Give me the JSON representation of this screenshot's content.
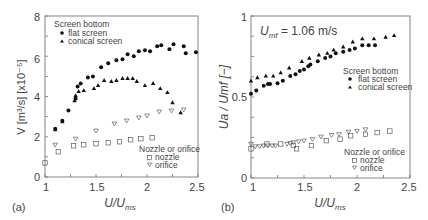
{
  "chart_data": [
    {
      "panel": "(a)",
      "type": "scatter",
      "xlabel": "U/U_ms",
      "ylabel": "V [m³/s] [x10⁻⁵]",
      "xlim": [
        1,
        2.5
      ],
      "ylim": [
        0,
        8
      ],
      "xticks": [
        "1",
        "1.5",
        "2",
        "2.5"
      ],
      "yticks": [
        "0",
        "2",
        "4",
        "6",
        "8"
      ],
      "grid": false,
      "legends": [
        {
          "title": "Screen bottom",
          "entries": [
            "flat screen",
            "conical screen"
          ],
          "position": "upper-left"
        },
        {
          "title": "Nozzle or orifice",
          "entries": [
            "nozzle",
            "orifice"
          ],
          "position": "lower-right"
        }
      ],
      "series": [
        {
          "name": "flat screen",
          "marker": "filled-circle",
          "points": [
            [
              1.1,
              2.4
            ],
            [
              1.17,
              2.8
            ],
            [
              1.23,
              3.3
            ],
            [
              1.3,
              3.9
            ],
            [
              1.32,
              4.5
            ],
            [
              1.35,
              4.65
            ],
            [
              1.42,
              4.95
            ],
            [
              1.47,
              5.0
            ],
            [
              1.55,
              5.45
            ],
            [
              1.62,
              5.65
            ],
            [
              1.7,
              5.8
            ],
            [
              1.76,
              5.85
            ],
            [
              1.81,
              6.1
            ],
            [
              1.87,
              6.0
            ],
            [
              1.92,
              6.25
            ],
            [
              1.98,
              6.3
            ],
            [
              2.03,
              6.25
            ],
            [
              2.1,
              6.5
            ],
            [
              2.14,
              6.55
            ],
            [
              2.22,
              6.35
            ],
            [
              2.26,
              6.6
            ],
            [
              2.36,
              6.5
            ],
            [
              2.38,
              6.15
            ],
            [
              2.48,
              6.2
            ]
          ]
        },
        {
          "name": "conical screen",
          "marker": "filled-triangle",
          "points": [
            [
              1.1,
              2.35
            ],
            [
              1.17,
              2.75
            ],
            [
              1.29,
              3.8
            ],
            [
              1.3,
              4.05
            ],
            [
              1.33,
              4.25
            ],
            [
              1.38,
              4.3
            ],
            [
              1.48,
              4.4
            ],
            [
              1.52,
              4.55
            ],
            [
              1.58,
              4.8
            ],
            [
              1.65,
              4.75
            ],
            [
              1.7,
              4.8
            ],
            [
              1.76,
              4.9
            ],
            [
              1.81,
              4.9
            ],
            [
              1.86,
              4.9
            ],
            [
              1.9,
              4.75
            ],
            [
              1.98,
              4.55
            ],
            [
              2.06,
              4.65
            ],
            [
              2.13,
              4.4
            ],
            [
              2.2,
              4.2
            ],
            [
              2.25,
              3.7
            ],
            [
              2.33,
              3.2
            ]
          ]
        },
        {
          "name": "nozzle",
          "marker": "open-square",
          "points": [
            [
              1.0,
              0.7
            ],
            [
              1.13,
              1.25
            ],
            [
              1.28,
              1.55
            ],
            [
              1.38,
              1.6
            ],
            [
              1.5,
              1.65
            ],
            [
              1.62,
              1.7
            ],
            [
              1.73,
              1.75
            ],
            [
              1.84,
              1.85
            ],
            [
              1.94,
              1.9
            ],
            [
              2.05,
              1.95
            ]
          ]
        },
        {
          "name": "orifice",
          "marker": "open-down-triangle",
          "points": [
            [
              1.1,
              1.6
            ],
            [
              1.3,
              1.9
            ],
            [
              1.5,
              2.3
            ],
            [
              1.68,
              2.65
            ],
            [
              1.8,
              2.8
            ],
            [
              1.92,
              2.95
            ],
            [
              2.0,
              3.05
            ],
            [
              2.12,
              3.25
            ],
            [
              2.24,
              3.3
            ],
            [
              2.36,
              3.35
            ]
          ]
        }
      ]
    },
    {
      "panel": "(b)",
      "type": "scatter",
      "xlabel": "U/U_ms",
      "ylabel": "U_a / U_mf [−]",
      "annotation": "U_mf = 1.06 m/s",
      "xlim": [
        1,
        2.5
      ],
      "ylim": [
        0,
        1
      ],
      "xticks": [
        "1",
        "1.5",
        "2",
        "2.5"
      ],
      "yticks": [
        "0",
        "0.5",
        "1"
      ],
      "grid": false,
      "legends": [
        {
          "title": "Screen bottom",
          "entries": [
            "flat screen",
            "conical screen"
          ],
          "position": "middle-right"
        },
        {
          "title": "Nozzle or orifice",
          "entries": [
            "nozzle",
            "orifice"
          ],
          "position": "lower-right"
        }
      ],
      "series": [
        {
          "name": "flat screen",
          "marker": "filled-circle",
          "points": [
            [
              1.0,
              0.52
            ],
            [
              1.05,
              0.54
            ],
            [
              1.12,
              0.57
            ],
            [
              1.16,
              0.58
            ],
            [
              1.18,
              0.58
            ],
            [
              1.25,
              0.585
            ],
            [
              1.3,
              0.6
            ],
            [
              1.37,
              0.63
            ],
            [
              1.42,
              0.64
            ],
            [
              1.46,
              0.66
            ],
            [
              1.5,
              0.67
            ],
            [
              1.54,
              0.69
            ],
            [
              1.56,
              0.7
            ],
            [
              1.63,
              0.72
            ],
            [
              1.7,
              0.74
            ],
            [
              1.75,
              0.75
            ],
            [
              1.8,
              0.77
            ],
            [
              1.87,
              0.78
            ],
            [
              1.93,
              0.79
            ],
            [
              1.98,
              0.8
            ],
            [
              2.05,
              0.82
            ],
            [
              2.11,
              0.82
            ],
            [
              2.17,
              0.82
            ]
          ]
        },
        {
          "name": "conical screen",
          "marker": "filled-triangle",
          "points": [
            [
              1.0,
              0.6
            ],
            [
              1.06,
              0.62
            ],
            [
              1.14,
              0.63
            ],
            [
              1.21,
              0.63
            ],
            [
              1.28,
              0.65
            ],
            [
              1.36,
              0.68
            ],
            [
              1.48,
              0.72
            ],
            [
              1.55,
              0.74
            ],
            [
              1.64,
              0.76
            ],
            [
              1.72,
              0.77
            ],
            [
              1.78,
              0.79
            ],
            [
              1.87,
              0.81
            ],
            [
              1.96,
              0.84
            ],
            [
              2.05,
              0.86
            ],
            [
              2.16,
              0.86
            ],
            [
              2.27,
              0.87
            ],
            [
              2.35,
              0.88
            ]
          ]
        },
        {
          "name": "nozzle",
          "marker": "open-square",
          "points": [
            [
              1.0,
              0.18
            ],
            [
              1.15,
              0.21
            ],
            [
              1.28,
              0.21
            ],
            [
              1.4,
              0.2
            ],
            [
              1.43,
              0.18
            ],
            [
              1.57,
              0.2
            ],
            [
              1.71,
              0.23
            ],
            [
              1.84,
              0.24
            ],
            [
              1.94,
              0.26
            ],
            [
              2.08,
              0.27
            ],
            [
              2.19,
              0.28
            ],
            [
              2.31,
              0.29
            ]
          ]
        },
        {
          "name": "orifice",
          "marker": "open-down-triangle",
          "points": [
            [
              1.0,
              0.21
            ],
            [
              1.04,
              0.195
            ],
            [
              1.08,
              0.195
            ],
            [
              1.12,
              0.2
            ],
            [
              1.16,
              0.2
            ],
            [
              1.2,
              0.2
            ],
            [
              1.23,
              0.2
            ],
            [
              1.34,
              0.21
            ],
            [
              1.37,
              0.215
            ],
            [
              1.4,
              0.22
            ],
            [
              1.45,
              0.225
            ],
            [
              1.5,
              0.23
            ],
            [
              1.58,
              0.24
            ],
            [
              1.66,
              0.255
            ],
            [
              1.76,
              0.265
            ],
            [
              1.83,
              0.27
            ],
            [
              1.92,
              0.285
            ],
            [
              2.0,
              0.29
            ],
            [
              2.08,
              0.3
            ]
          ]
        }
      ]
    }
  ],
  "panels": {
    "a": {
      "label": "(a)",
      "xlabel_main": "U",
      "xlabel_sep": "/",
      "xlabel_den": "U",
      "xlabel_sub": "ms",
      "ylabel": "V [m³/s] [x10⁻⁵]",
      "ytick_labels": [
        "0",
        "2",
        "4",
        "6",
        "8"
      ],
      "xtick_labels": [
        "1",
        "1.5",
        "2",
        "2.5"
      ],
      "legend1_title": "Screen bottom",
      "legend1_item1": "flat screen",
      "legend1_item2": "conical screen",
      "legend2_title": "Nozzle or orifice",
      "legend2_item1": "nozzle",
      "legend2_item2": "orifice"
    },
    "b": {
      "label": "(b)",
      "xlabel_main": "U",
      "xlabel_sep": "/",
      "xlabel_den": "U",
      "xlabel_sub": "ms",
      "ylabel": "Ua / Umf [−]",
      "annotation_main": "U",
      "annotation_sub": "mf",
      "annotation_value": " = 1.06 m/s",
      "ytick_labels": [
        "0",
        "0.5",
        "1"
      ],
      "xtick_labels": [
        "1",
        "1.5",
        "2",
        "2.5"
      ],
      "legend1_title": "Screen bottom",
      "legend1_item1": "flat screen",
      "legend1_item2": "conical screen",
      "legend2_title": "Nozzle or orifice",
      "legend2_item1": "nozzle",
      "legend2_item2": "orifice"
    }
  },
  "colors": {
    "axis": "#666666",
    "marker": "#111111",
    "text": "#444444"
  }
}
